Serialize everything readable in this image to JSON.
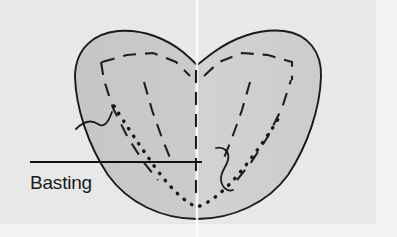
{
  "figure": {
    "kind": "sewing-instruction-diagram",
    "width": 397,
    "height": 237
  },
  "colors": {
    "page_background": "#f2f2f2",
    "paper_background": "#eeeeee",
    "fabric_fill": "#c9c9c9",
    "fabric_fill_light": "#d4d4d4",
    "outline": "#1a1a1a",
    "dash_line": "#1f1f1f",
    "dot_line": "#141414",
    "fold_line": "#fafafa",
    "label_color": "#1b1b1b",
    "leader_line": "#111111"
  },
  "annotations": {
    "basting": {
      "label": "Basting",
      "label_x": 30,
      "label_y": 189,
      "leader_x1": 30,
      "leader_y1": 162,
      "leader_x2": 202,
      "leader_y2": 162
    }
  },
  "elements": {
    "fabric_outline_name": "fabric-piece-outline",
    "fold_line_name": "center-fold-line",
    "dotted_basting_name": "basting-stitch-dotted-line",
    "dashed_seam_name": "dashed-seam-lines",
    "thread_left_name": "thread-tail-left",
    "thread_right_name": "thread-tail-right"
  },
  "geometry": {
    "fabric_path": "M 75 77 C 75 48 95 33 118 31 C 145 29 168 40 183 52 C 190 58 194 62 197 65 C 201 62 207 57 214 52 C 232 39 258 28 284 31 C 308 34 322 52 321 77 C 320 108 308 145 288 175 C 268 203 232 219 197 219 C 162 219 128 203 108 175 C 88 145 76 108 75 77 Z",
    "dot_path": "M 114 106 C 124 122 140 146 157 170 C 172 190 186 203 197 207 C 210 203 226 190 242 170 C 258 150 272 130 281 114",
    "thread_left_path": "M 76 129 C 84 121 92 120 98 124 C 104 128 108 123 112 112",
    "thread_right_path": "M 216 148 C 224 146 230 152 228 160 C 226 168 220 172 221 180 C 222 188 228 192 233 190",
    "dash_arcs": [
      "M 102 62 L 127 55 L 153 53 L 176 62 L 190 76",
      "M 204 76 L 219 62 L 242 53 L 268 55 L 292 62 L 292 80",
      "M 101 62 L 104 80 L 113 108 L 128 138 L 145 164 L 158 180",
      "M 237 180 L 250 164 L 267 138 L 282 108 L 291 80",
      "M 196 70 L 196 105 L 196 140 L 196 175 L 196 200",
      "M 144 82 L 152 110 L 162 138 L 170 158",
      "M 250 82 L 242 110 L 232 138 L 224 158"
    ]
  }
}
